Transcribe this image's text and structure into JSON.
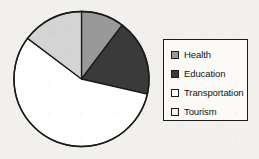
{
  "chart_data": {
    "type": "pie",
    "title": "",
    "categories": [
      "Health",
      "Education",
      "Transportation",
      "Tourism"
    ],
    "values": [
      10.3,
      18.3,
      56.7,
      14.7
    ],
    "units": "percent",
    "start_angle_deg": 0,
    "direction": "clockwise",
    "slice_angles_deg": [
      37,
      66,
      204,
      53
    ],
    "slice_boundaries_deg": [
      0,
      37,
      103,
      307,
      360
    ],
    "colors": [
      "#999999",
      "#3a3a3a",
      "#ffffff",
      "#d4d4d4"
    ],
    "labels_shown": false,
    "legend_position": "right",
    "grid": false,
    "series": [
      {
        "name": "Budget share",
        "points": [
          {
            "label": "Health",
            "value": 10.3,
            "color": "#999999"
          },
          {
            "label": "Education",
            "value": 18.3,
            "color": "#3a3a3a"
          },
          {
            "label": "Transportation",
            "value": 56.7,
            "color": "#ffffff"
          },
          {
            "label": "Tourism",
            "value": 14.7,
            "color": "#d4d4d4"
          }
        ]
      }
    ]
  },
  "pie": {
    "center_x": 81.5,
    "center_y": 79,
    "radius": 67.5,
    "outline_color": "#1b1b1b"
  },
  "legend": {
    "entries": [
      {
        "label": "Health",
        "color": "#999999"
      },
      {
        "label": "Education",
        "color": "#3a3a3a"
      },
      {
        "label": "Transportation",
        "color": "#ffffff"
      },
      {
        "label": "Tourism",
        "color": "#f2f2f2"
      }
    ]
  }
}
